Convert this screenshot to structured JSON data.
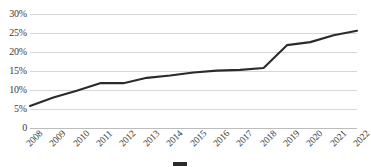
{
  "chart_data": {
    "type": "line",
    "title": "",
    "subtitle": "",
    "xlabel": "",
    "ylabel": "",
    "grid": true,
    "legend_position": "none",
    "ylim": [
      0,
      30
    ],
    "yticks": [
      0,
      5,
      10,
      15,
      20,
      25,
      30
    ],
    "ytick_labels": [
      "0",
      "5%",
      "10%",
      "15%",
      "20%",
      "25%",
      "30%"
    ],
    "categories": [
      "2008",
      "2009",
      "2010",
      "2011",
      "2012",
      "2013",
      "2014",
      "2015",
      "2016",
      "2017",
      "2018",
      "2019",
      "2020",
      "2021",
      "2022"
    ],
    "x": [
      "2008",
      "2009",
      "2010",
      "2011",
      "2012",
      "2013",
      "2014",
      "2015",
      "2016",
      "2017",
      "2018",
      "2019",
      "2020",
      "2021",
      "2022"
    ],
    "series": [
      {
        "name": "",
        "color": "#2b2b2b",
        "values": [
          5.8,
          8.0,
          9.8,
          11.8,
          11.8,
          13.2,
          13.8,
          14.6,
          15.1,
          15.3,
          15.8,
          21.8,
          22.6,
          24.4,
          25.6
        ]
      }
    ],
    "annotations": []
  },
  "axes": {
    "y_labels": [
      "30%",
      "25%",
      "20%",
      "15%",
      "10%",
      "5%",
      "0"
    ],
    "x_labels": [
      "2008",
      "2009",
      "2010",
      "2011",
      "2012",
      "2013",
      "2014",
      "2015",
      "2016",
      "2017",
      "2018",
      "2019",
      "2020",
      "2021",
      "2022"
    ]
  },
  "caption": {
    "swatch_name": "line-series-swatch",
    "text": ""
  },
  "colors": {
    "series_line": "#2b2b2b",
    "gridline": "#d6d6d6",
    "text": "#3a3a3a",
    "background": "#ffffff"
  }
}
